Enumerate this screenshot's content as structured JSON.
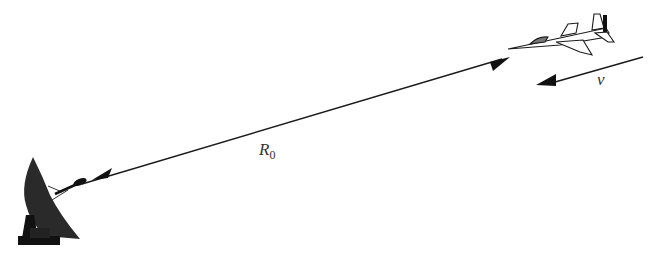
{
  "diagram": {
    "type": "radar-geometry",
    "labels": {
      "range": {
        "symbol": "R",
        "subscript": "0"
      },
      "velocity": {
        "symbol": "v"
      }
    },
    "elements": [
      {
        "name": "radar-dish-antenna",
        "position": "bottom-left"
      },
      {
        "name": "aircraft",
        "position": "top-right"
      },
      {
        "name": "range-line",
        "description": "double-headed arrow from radar to aircraft",
        "label": "R0"
      },
      {
        "name": "velocity-arrow",
        "description": "arrow pointing toward radar",
        "label": "v"
      }
    ],
    "colors": {
      "ink": "#1a1a1a",
      "background": "#ffffff"
    }
  }
}
